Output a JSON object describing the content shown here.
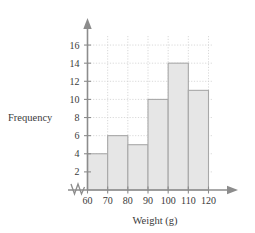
{
  "chart_data": {
    "type": "bar",
    "title": "",
    "subtitle": "",
    "xlabel": "Weight (g)",
    "ylabel": "Frequency",
    "categories": [
      "60-70",
      "70-80",
      "80-90",
      "90-100",
      "100-110",
      "110-120"
    ],
    "bin_edges": [
      60,
      70,
      80,
      90,
      100,
      110,
      120
    ],
    "values": [
      4,
      6,
      5,
      10,
      14,
      11
    ],
    "xtick_labels": [
      "60",
      "70",
      "80",
      "90",
      "100",
      "110",
      "120"
    ],
    "xtick_values": [
      60,
      70,
      80,
      90,
      100,
      110,
      120
    ],
    "ytick_labels": [
      "2",
      "4",
      "6",
      "8",
      "10",
      "12",
      "14",
      "16"
    ],
    "ytick_values": [
      2,
      4,
      6,
      8,
      10,
      12,
      14,
      16
    ],
    "xlim": [
      60,
      120
    ],
    "ylim": [
      0,
      17
    ],
    "grid": true,
    "legend": "none",
    "axis_break_x": true,
    "bar_color": "#e6e6e6",
    "bar_border_color": "#a8a8a8",
    "axis_color": "#8c8c8c",
    "grid_color": "#cfcfcf"
  }
}
